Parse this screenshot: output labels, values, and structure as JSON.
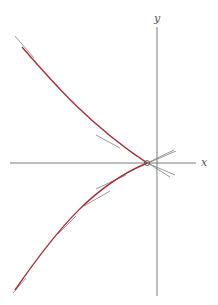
{
  "figure": {
    "axes": {
      "x_label": "x",
      "y_label": "y",
      "color": "#6e6e6e"
    },
    "curve": {
      "color": "#a3313c",
      "upper_branch_path": "M22,47 C55,85 90,125 147,163",
      "lower_branch_path": "M147,163 C95,185 60,225 15,290"
    },
    "tangent_color": "#808080",
    "tangents": [
      {
        "x1": 15,
        "y1": 36,
        "x2": 34,
        "y2": 58
      },
      {
        "x1": 96,
        "y1": 135,
        "x2": 120,
        "y2": 148
      },
      {
        "x1": 132,
        "y1": 153,
        "x2": 170,
        "y2": 177
      },
      {
        "x1": 132,
        "y1": 170,
        "x2": 176,
        "y2": 151
      },
      {
        "x1": 147,
        "y1": 163,
        "x2": 175,
        "y2": 175
      },
      {
        "x1": 147,
        "y1": 163,
        "x2": 174,
        "y2": 150
      },
      {
        "x1": 96,
        "y1": 189,
        "x2": 126,
        "y2": 175
      },
      {
        "x1": 84,
        "y1": 206,
        "x2": 110,
        "y2": 191
      },
      {
        "x1": 58,
        "y1": 234,
        "x2": 76,
        "y2": 216
      },
      {
        "x1": 13,
        "y1": 293,
        "x2": 26,
        "y2": 278
      }
    ],
    "cusp_point": {
      "cx": 147,
      "cy": 163,
      "r": 2.5
    }
  }
}
